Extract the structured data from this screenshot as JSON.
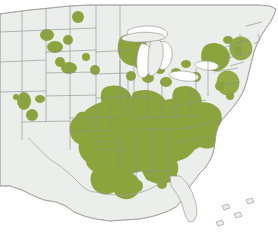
{
  "figure": {
    "kind": "distribution-map",
    "region": "United States (central and eastern)",
    "projection": "albers-equal-area-conic",
    "title": "",
    "caption": "",
    "legend_visible": false,
    "labels_visible": false
  },
  "colors": {
    "range_fill": "#8ba53c",
    "range_fill_soft": "#93aa46",
    "land_fill": "#eceeec",
    "water_fill": "#ffffff",
    "border_stroke": "#8b8d8b",
    "page_background": "#ffffff"
  },
  "chart_data": {
    "type": "heatmap",
    "title": "",
    "xlabel": "",
    "ylabel": "",
    "categories": [
      "Alabama",
      "Arkansas",
      "Colorado",
      "Connecticut",
      "Delaware",
      "Florida",
      "Georgia",
      "Illinois",
      "Indiana",
      "Iowa",
      "Kansas",
      "Kentucky",
      "Louisiana",
      "Maine",
      "Maryland",
      "Massachusetts",
      "Michigan",
      "Minnesota",
      "Mississippi",
      "Missouri",
      "Montana",
      "Nebraska",
      "New Hampshire",
      "New Jersey",
      "New York",
      "North Carolina",
      "North Dakota",
      "Ohio",
      "Oklahoma",
      "Pennsylvania",
      "Rhode Island",
      "South Carolina",
      "South Dakota",
      "Tennessee",
      "Texas",
      "Utah",
      "Vermont",
      "Virginia",
      "West Virginia",
      "Wisconsin"
    ],
    "values": [
      3,
      3,
      1,
      2,
      2,
      1,
      3,
      3,
      3,
      2,
      2,
      3,
      3,
      0,
      2,
      2,
      2,
      2,
      3,
      3,
      0,
      1,
      1,
      2,
      2,
      3,
      1,
      3,
      2,
      2,
      1,
      2,
      1,
      3,
      2,
      1,
      1,
      3,
      3,
      2
    ],
    "value_scale": {
      "0": "not recorded",
      "1": "scattered records",
      "2": "frequent records",
      "3": "widespread / continuous"
    },
    "legend_position": "none",
    "grid": false
  },
  "accessibility": {
    "alt_text": "Map of the United States with green shading covering the southeastern and central states, scattered dots through the Midwest, Northeast and a few western points."
  }
}
